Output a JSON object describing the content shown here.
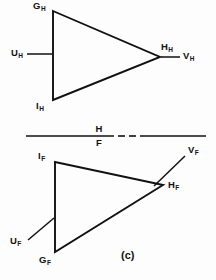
{
  "figure": {
    "caption": "(c)",
    "fold_line": {
      "upper_label": "H",
      "lower_label": "F"
    },
    "stroke_color": "#111111",
    "background_color": "#fdfdfd",
    "upper_view": {
      "name": "horizontal-view",
      "vertices": [
        {
          "id": "G_H",
          "base": "G",
          "sub": "H"
        },
        {
          "id": "H_H",
          "base": "H",
          "sub": "H"
        },
        {
          "id": "I_H",
          "base": "I",
          "sub": "H"
        }
      ],
      "leaders": [
        {
          "id": "U_H",
          "base": "U",
          "sub": "H"
        },
        {
          "id": "V_H",
          "base": "V",
          "sub": "H"
        }
      ]
    },
    "lower_view": {
      "name": "frontal-view",
      "vertices": [
        {
          "id": "I_F",
          "base": "I",
          "sub": "F"
        },
        {
          "id": "H_F",
          "base": "H",
          "sub": "F"
        },
        {
          "id": "G_F",
          "base": "G",
          "sub": "F"
        }
      ],
      "leaders": [
        {
          "id": "U_F",
          "base": "U",
          "sub": "F"
        },
        {
          "id": "V_F",
          "base": "V",
          "sub": "F"
        }
      ]
    }
  }
}
